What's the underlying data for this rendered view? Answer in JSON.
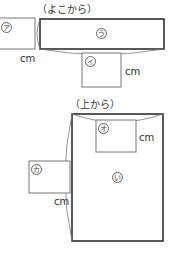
{
  "side_view": {
    "heading": "（よこから）",
    "labels": {
      "a": "ア",
      "i": "イ",
      "u": "う"
    },
    "cm_labels": [
      "cm",
      "cm"
    ]
  },
  "top_view": {
    "heading": "（上から）",
    "labels": {
      "o": "オ",
      "ka": "カ",
      "i": "い"
    },
    "cm_labels": [
      "cm",
      "cm"
    ]
  },
  "colors": {
    "stroke": "#333333",
    "thin_stroke": "#777777"
  }
}
